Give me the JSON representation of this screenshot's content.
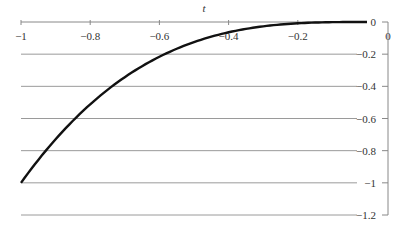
{
  "chart_data": {
    "type": "line",
    "title": "",
    "xlabel": "t",
    "ylabel": "",
    "xlim": [
      -1,
      0
    ],
    "ylim": [
      -1.2,
      0
    ],
    "x_ticks": [
      "−1",
      "−0.8",
      "−0.6",
      "−0.4",
      "−0.2",
      "0"
    ],
    "y_ticks": [
      "0",
      "−0.2",
      "−0.4",
      "−0.6",
      "−0.8",
      "−1",
      "−1.2"
    ],
    "grid": true,
    "x_axis_position": "top",
    "y_axis_position": "right",
    "series": [
      {
        "name": "y = t^3",
        "color": "#111111",
        "x": [
          -1,
          -0.9,
          -0.8,
          -0.7,
          -0.6,
          -0.5,
          -0.4,
          -0.3,
          -0.2,
          -0.1,
          0
        ],
        "values": [
          -1,
          -0.729,
          -0.512,
          -0.343,
          -0.216,
          -0.125,
          -0.064,
          -0.027,
          -0.008,
          -0.001,
          0
        ]
      }
    ]
  },
  "colors": {
    "curve": "#111111",
    "grid": "#9a9a9a",
    "axis": "#888888",
    "text": "#333333"
  }
}
